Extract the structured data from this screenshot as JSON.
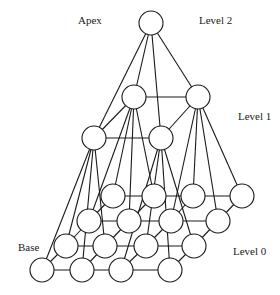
{
  "labels": {
    "apex": "Apex",
    "level2": "Level 2",
    "level1": "Level 1",
    "base": "Base",
    "level0": "Level 0"
  },
  "pyramid": {
    "levels": [
      {
        "name": "Level 2",
        "rows": 1,
        "cols": 1
      },
      {
        "name": "Level 1",
        "rows": 2,
        "cols": 2
      },
      {
        "name": "Level 0",
        "rows": 4,
        "cols": 4
      }
    ],
    "connections": "each parent node connects to its 2x2 block of children; nodes within a level connect to grid neighbours"
  }
}
